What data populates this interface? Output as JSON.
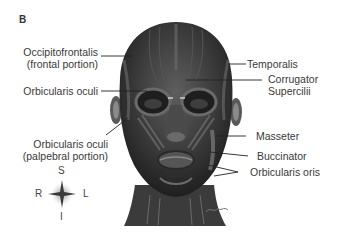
{
  "figure": {
    "panel_letter": "B"
  },
  "labels_left": [
    {
      "line1": "Occipitofrontalis",
      "line2": "(frontal portion)"
    },
    {
      "line1": "Orbicularis oculi",
      "line2": ""
    },
    {
      "line1": "Orbicularis oculi",
      "line2": "(palpebral portion)"
    }
  ],
  "labels_right": [
    {
      "line1": "Temporalis",
      "line2": ""
    },
    {
      "line1": "Corrugator",
      "line2": "Supercilii"
    },
    {
      "line1": "Masseter",
      "line2": ""
    },
    {
      "line1": "Buccinator",
      "line2": ""
    },
    {
      "line1": "Orbicularis oris",
      "line2": ""
    }
  ],
  "compass": {
    "superior": "S",
    "inferior": "I",
    "right": "R",
    "left": "L"
  },
  "colors": {
    "muscle_dark": "#2b2b2b",
    "muscle_mid": "#5a5a5a",
    "highlight": "#9a9a9a",
    "text": "#3a3a3a",
    "leader_line": "#222222"
  }
}
